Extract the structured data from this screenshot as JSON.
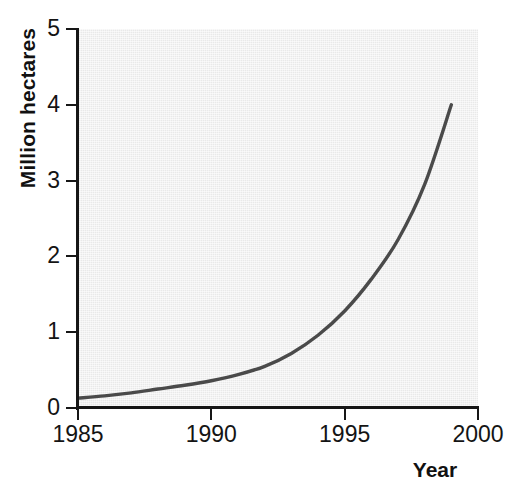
{
  "chart_data": {
    "type": "line",
    "title": "",
    "subtitle": "",
    "xlabel": "Year",
    "ylabel": "Million hectares",
    "xlim": [
      1985,
      2000
    ],
    "ylim": [
      0,
      5
    ],
    "grid": false,
    "legend": null,
    "x_ticks": [
      "1985",
      "1990",
      "1995",
      "2000"
    ],
    "x_tick_values": [
      1985,
      1990,
      1995,
      2000
    ],
    "y_ticks": [
      "0",
      "1",
      "2",
      "3",
      "4",
      "5"
    ],
    "y_tick_values": [
      0,
      1,
      2,
      3,
      4,
      5
    ],
    "series": [
      {
        "name": "Area",
        "color": "#4a4a4a",
        "line_width": 3.4,
        "x": [
          1985,
          1986,
          1987,
          1988,
          1989,
          1990,
          1991,
          1992,
          1993,
          1994,
          1995,
          1996,
          1997,
          1998,
          1999
        ],
        "values": [
          0.13,
          0.16,
          0.2,
          0.25,
          0.3,
          0.36,
          0.44,
          0.55,
          0.72,
          0.96,
          1.28,
          1.7,
          2.22,
          2.95,
          4.0
        ]
      }
    ],
    "annotations": []
  },
  "axes": {
    "y_title": "Million hectares",
    "x_title": "Year"
  },
  "colors": {
    "plot_background": "#e9e9e9",
    "figure_background": "#ffffff",
    "axis": "#161616",
    "curve": "#4a4a4a",
    "text": "#141414"
  }
}
